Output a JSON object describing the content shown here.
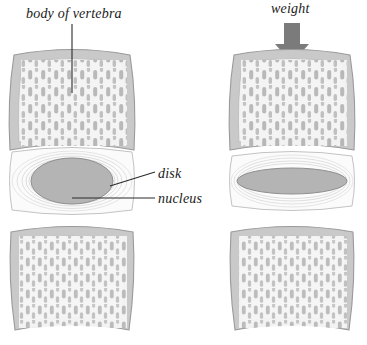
{
  "figure": {
    "background_color": "#ffffff",
    "width": 367,
    "height": 345
  },
  "labels": {
    "body_of_vertebra": "body of vertebra",
    "weight": "weight",
    "disk": "disk",
    "nucleus": "nucleus"
  },
  "colors": {
    "bone_fill": "#c9c9c9",
    "bone_outline": "#9a9a9a",
    "trabecula": "#b0b0b0",
    "marrow_fill": "#f2f2f2",
    "disk_fill": "#fbfbfb",
    "annulus_ring": "#dcdcdc",
    "nucleus_fill": "#b4b4b4",
    "nucleus_outline": "#8f8f8f",
    "arrow": "#7b7b7b",
    "leader_line": "#3a3a3a",
    "text": "#1a1a1a"
  },
  "panels": [
    {
      "name": "unloaded",
      "side": "left",
      "loaded": false,
      "disk_height_px": 60,
      "nucleus_shape": "tall-round",
      "nucleus_width_px": 82,
      "nucleus_height_px": 46
    },
    {
      "name": "loaded",
      "side": "right",
      "loaded": true,
      "disk_height_px": 48,
      "nucleus_shape": "flattened-wide",
      "nucleus_width_px": 110,
      "nucleus_height_px": 26
    }
  ],
  "structures": [
    {
      "name": "upper-vertebral-body",
      "count": 2
    },
    {
      "name": "intervertebral-disk",
      "count": 2
    },
    {
      "name": "nucleus-pulposus",
      "count": 2
    },
    {
      "name": "lower-vertebral-body",
      "count": 2
    }
  ],
  "annotations": {
    "weight_arrow_direction": "down"
  }
}
